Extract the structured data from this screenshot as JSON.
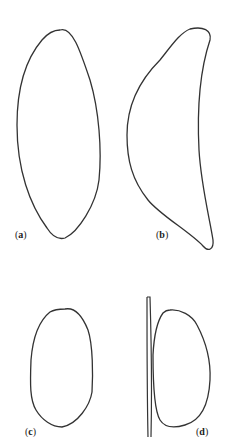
{
  "figure": {
    "panels": [
      {
        "id": "a",
        "label": "a",
        "shape": "lens-shaped closed outline"
      },
      {
        "id": "b",
        "label": "b",
        "shape": "crescent-shaped closed outline"
      },
      {
        "id": "c",
        "label": "c",
        "shape": "oval closed outline"
      },
      {
        "id": "d",
        "label": "d",
        "shape": "D-shaped closed outline beside a thin vertical rod"
      }
    ],
    "stroke_color": "#333333",
    "background": "#ffffff"
  }
}
